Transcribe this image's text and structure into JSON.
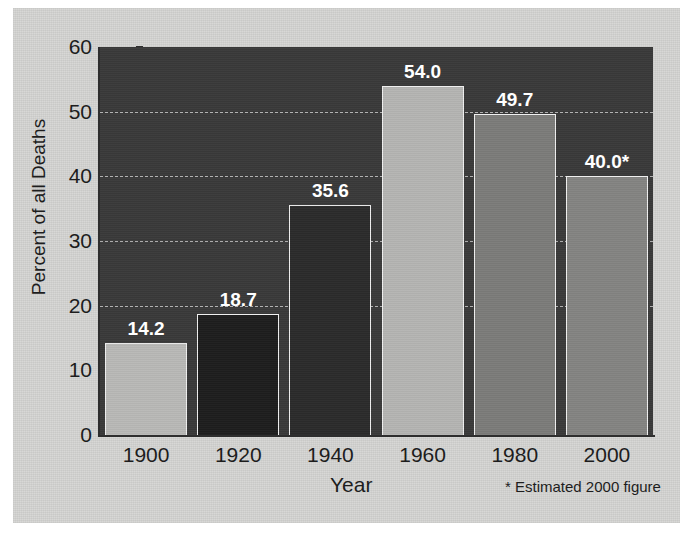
{
  "chart_data": {
    "type": "bar",
    "title": "",
    "xlabel": "Year",
    "ylabel": "Percent of all Deaths",
    "categories": [
      "1900",
      "1920",
      "1940",
      "1960",
      "1980",
      "2000"
    ],
    "values": [
      14.2,
      18.7,
      35.6,
      54.0,
      49.7,
      40.0
    ],
    "value_labels": [
      "14.2",
      "18.7",
      "35.6",
      "54.0",
      "49.7",
      "40.0*"
    ],
    "bar_colors": [
      "#b9b9b7",
      "#1e1e1e",
      "#2b2b2b",
      "#b5b5b3",
      "#7c7c7a",
      "#848482"
    ],
    "bar_border_color": "#f0f0f0",
    "ylim": [
      0,
      60
    ],
    "ytick_values": [
      0,
      10,
      20,
      30,
      40,
      50,
      60
    ],
    "ytick_labels": [
      "0",
      "10",
      "20",
      "30",
      "40",
      "50",
      "60"
    ],
    "grid": true,
    "gridline_values": [
      20,
      30,
      40,
      50
    ],
    "gridline_style": "dashed",
    "legend": "none",
    "annotations": [
      "* Estimated 2000 figure"
    ],
    "plot_background_color": "#3a3a3a",
    "page_background_color": "#d6d6d4"
  },
  "axes": {
    "y_title": "Percent of all Deaths",
    "x_title": "Year"
  },
  "footnote": {
    "text": "* Estimated 2000 figure"
  }
}
